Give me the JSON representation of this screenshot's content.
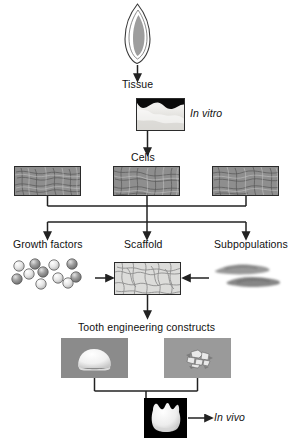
{
  "figure": {
    "domain": "biomedical-flow-diagram",
    "background_color": "#ffffff",
    "ink_color": "#222222"
  },
  "labels": {
    "tissue": "Tissue",
    "in_vitro": "In vitro",
    "cells": "Cells",
    "growth_factors": "Growth factors",
    "scaffold": "Scaffold",
    "subpopulations": "Subpopulations",
    "constructs": "Tooth engineering constructs",
    "in_vivo": "In vivo"
  },
  "nodes": [
    {
      "id": "tooth-source",
      "kind": "illustration",
      "depicts": "tooth-incisor-outline",
      "fill": "#9a9a9a",
      "stroke": "#333333"
    },
    {
      "id": "tissue-panel",
      "kind": "micrograph",
      "label": "Tissue",
      "side_label": "In vitro",
      "depicts": "tooth-germ-histology-section",
      "tone": "light-gray"
    },
    {
      "id": "cells-panel-left",
      "kind": "micrograph",
      "depicts": "cultured-cells-fibrous",
      "tone": "mid-gray"
    },
    {
      "id": "cells-panel-mid",
      "kind": "micrograph",
      "depicts": "cultured-cells-fibrous",
      "tone": "mid-gray"
    },
    {
      "id": "cells-panel-right",
      "kind": "micrograph",
      "depicts": "cultured-cells-fibrous",
      "tone": "mid-gray"
    },
    {
      "id": "growth-factors",
      "kind": "illustration",
      "label": "Growth factors",
      "depicts": "sphere-cluster",
      "sphere_count": 11
    },
    {
      "id": "scaffold",
      "kind": "illustration",
      "label": "Scaffold",
      "depicts": "porous-fiber-mesh-block",
      "fill": "#dcdcda"
    },
    {
      "id": "subpopulations",
      "kind": "micrograph",
      "label": "Subpopulations",
      "depicts": "cell-subpopulation-brush-strokes",
      "stroke_count": 2
    },
    {
      "id": "construct-left",
      "kind": "photograph",
      "depicts": "tooth-construct-dome",
      "tone": "dark-gray"
    },
    {
      "id": "construct-right",
      "kind": "photograph",
      "depicts": "tooth-construct-mineralized",
      "tone": "mid-gray"
    },
    {
      "id": "invivo-panel",
      "kind": "photograph",
      "side_label": "In vivo",
      "depicts": "tooth-crown-multicusped",
      "tone": "black-background"
    }
  ],
  "edges": [
    {
      "from": "tooth-source",
      "to": "tissue-panel",
      "type": "arrow-down"
    },
    {
      "from": "tissue-panel",
      "to": "cells-panel-mid",
      "type": "arrow-down"
    },
    {
      "from": "cells-panels",
      "to": "three-branches",
      "type": "bus-split"
    },
    {
      "from": "growth-factors",
      "to": "scaffold",
      "type": "arrow-right"
    },
    {
      "from": "subpopulations",
      "to": "scaffold",
      "type": "arrow-left"
    },
    {
      "from": "scaffold",
      "to": "constructs",
      "type": "arrow-down"
    },
    {
      "from": "constructs",
      "to": "invivo-panel",
      "type": "bus-merge"
    },
    {
      "from": "invivo-panel",
      "to": "in-vivo-label",
      "type": "arrow-right"
    }
  ]
}
